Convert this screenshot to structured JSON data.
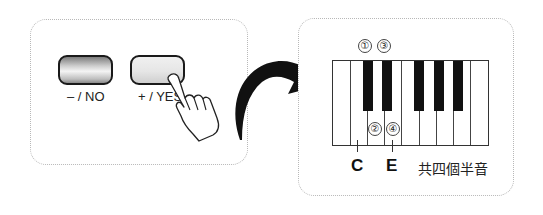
{
  "left_panel": {
    "buttons": [
      {
        "label": "– / NO",
        "state": "idle"
      },
      {
        "label": "+ / YES",
        "state": "pressed"
      }
    ],
    "pointer": "hand-pointer-icon"
  },
  "transition": {
    "icon": "curved-arrow-icon"
  },
  "right_panel": {
    "keyboard": {
      "white_keys": 9,
      "black_keys": 5
    },
    "step_markers_top": [
      "①",
      "③"
    ],
    "step_markers_bottom": [
      "②",
      "④"
    ],
    "note_labels": [
      "C",
      "E"
    ],
    "caption": "共四個半音"
  }
}
